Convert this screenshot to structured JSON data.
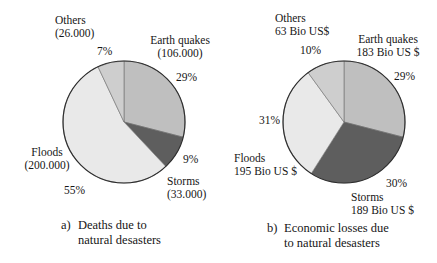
{
  "page": {
    "background": "#ffffff",
    "text_color": "#161616"
  },
  "chart_data": [
    {
      "type": "pie",
      "id": "deaths",
      "caption_marker": "a)",
      "caption_lines": [
        "Deaths due to",
        "natural desasters"
      ],
      "start_angle_deg": 0,
      "direction": "clockwise",
      "outline_color": "#2f2f2f",
      "divider_color": "#6e6e6e",
      "slices": [
        {
          "name": "Earth quakes",
          "value_label": "(106.000)",
          "pct": 29,
          "pct_label": "29%",
          "color": "#bfbfbf"
        },
        {
          "name": "Storms",
          "value_label": "(33.000)",
          "pct": 9,
          "pct_label": "9%",
          "color": "#5e5e5e"
        },
        {
          "name": "Floods",
          "value_label": "(200.000)",
          "pct": 55,
          "pct_label": "55%",
          "color": "#e9e9e9"
        },
        {
          "name": "Others",
          "value_label": "(26.000)",
          "pct": 7,
          "pct_label": "7%",
          "color": "#cecece"
        }
      ]
    },
    {
      "type": "pie",
      "id": "losses",
      "caption_marker": "b)",
      "caption_lines": [
        "Economic losses due",
        "to natural desasters"
      ],
      "start_angle_deg": 0,
      "direction": "clockwise",
      "outline_color": "#2f2f2f",
      "divider_color": "#6e6e6e",
      "slices": [
        {
          "name": "Earth quakes",
          "value_label": "183 Bio US $",
          "pct": 29,
          "pct_label": "29%",
          "color": "#bfbfbf"
        },
        {
          "name": "Storms",
          "value_label": "189 Bio US $",
          "pct": 30,
          "pct_label": "30%",
          "color": "#5e5e5e"
        },
        {
          "name": "Floods",
          "value_label": "195 Bio US $",
          "pct": 31,
          "pct_label": "31%",
          "color": "#e9e9e9"
        },
        {
          "name": "Others",
          "value_label": "63 Bio US$",
          "pct": 10,
          "pct_label": "10%",
          "color": "#cecece"
        }
      ]
    }
  ]
}
